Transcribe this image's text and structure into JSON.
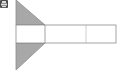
{
  "toolbar": {
    "icon": "print-icon"
  },
  "diagram": {
    "colors": {
      "fill": "#a8a8a8",
      "stroke": "#8c8c8c",
      "background": "#ffffff",
      "icon_bg": "#4a4a4a"
    },
    "strip": {
      "x": 16,
      "y": 25,
      "width": 100,
      "height": 18,
      "dividers": [
        45,
        86
      ]
    },
    "top_triangle": [
      [
        16,
        0
      ],
      [
        45,
        25
      ],
      [
        16,
        25
      ]
    ],
    "bottom_triangle": [
      [
        16,
        43
      ],
      [
        45,
        43
      ],
      [
        16,
        70
      ]
    ]
  }
}
